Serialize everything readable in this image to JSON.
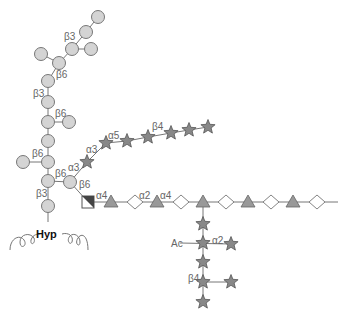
{
  "diagram": {
    "type": "glycan-structure",
    "anchor_label": "Hyp",
    "substituent_label": "Ac",
    "colors": {
      "galactose_circle": "#d4d4d4",
      "arabinose_star": "#888888",
      "rhamnose_triangle": "#999999",
      "glcA_diamond_half": "#dddddd",
      "square_dark": "#444444"
    },
    "linkage_labels": [
      {
        "text": "β3",
        "x": 64,
        "y": 40
      },
      {
        "text": "β6",
        "x": 56,
        "y": 78
      },
      {
        "text": "β3",
        "x": 33,
        "y": 97
      },
      {
        "text": "β6",
        "x": 55,
        "y": 117
      },
      {
        "text": "β6",
        "x": 32,
        "y": 157
      },
      {
        "text": "β6",
        "x": 55,
        "y": 177
      },
      {
        "text": "β3",
        "x": 36,
        "y": 197
      },
      {
        "text": "α3",
        "x": 68,
        "y": 171
      },
      {
        "text": "α3",
        "x": 86,
        "y": 153
      },
      {
        "text": "α5",
        "x": 108,
        "y": 139
      },
      {
        "text": "β4",
        "x": 152,
        "y": 130
      },
      {
        "text": "β6",
        "x": 79,
        "y": 188
      },
      {
        "text": "α4",
        "x": 96,
        "y": 199
      },
      {
        "text": "α2",
        "x": 139,
        "y": 199
      },
      {
        "text": "α4",
        "x": 160,
        "y": 199
      },
      {
        "text": "α2",
        "x": 212,
        "y": 244
      },
      {
        "text": "β4",
        "x": 188,
        "y": 282
      }
    ]
  }
}
